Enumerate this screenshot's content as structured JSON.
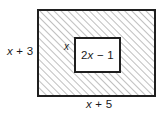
{
  "figure": {
    "type": "geometry-diagram",
    "outer_rectangle": {
      "name": "shaded-region",
      "fill": "diagonal-hatch",
      "hatch_color": "#8a8a8a",
      "border_color": "#1f1f1f",
      "height_label": "x + 3",
      "width_label": "x + 5"
    },
    "inner_rectangle": {
      "name": "white-hole",
      "fill": "#ffffff",
      "border_color": "#1f1f1f",
      "height_label": "x",
      "width_label": "2x − 1"
    }
  },
  "labels": {
    "outer_height": "x + 3",
    "outer_width": "x + 5",
    "inner_height": "x",
    "inner_width": "2x − 1"
  },
  "colors": {
    "ink": "#1f1f1f",
    "hatch": "#8a8a8a",
    "background": "#ffffff"
  }
}
